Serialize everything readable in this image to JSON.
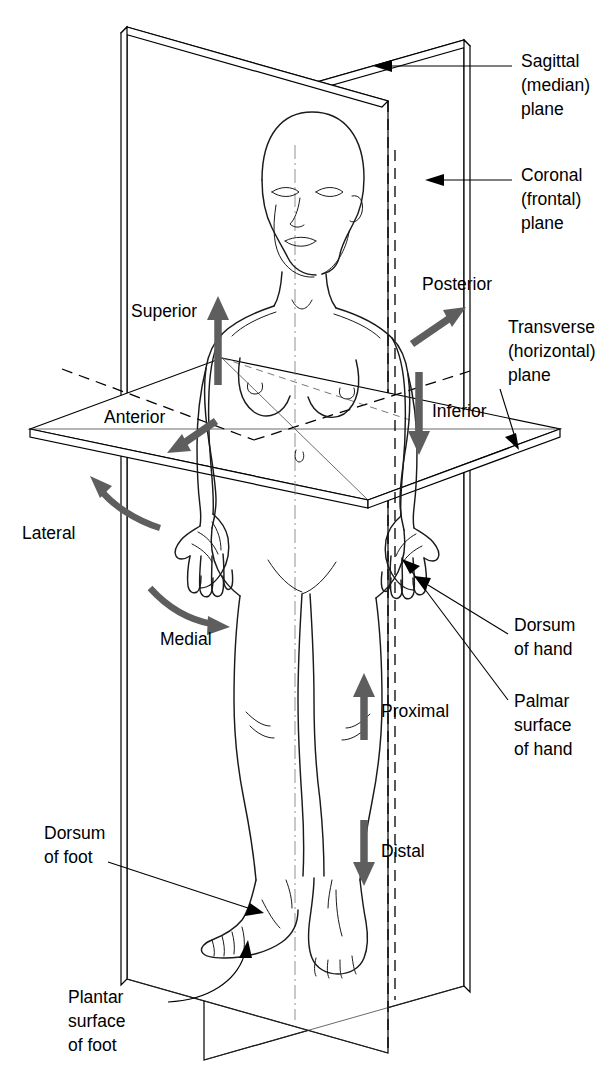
{
  "diagram": {
    "accent_color": "#5e5e5e",
    "line_color": "#000000",
    "background": "#ffffff"
  },
  "plane_labels": [
    {
      "id": "sagittal",
      "lines": [
        "Sagittal",
        "(median)",
        "plane"
      ],
      "line1": "Sagittal",
      "line2": "(median)",
      "line3": "plane"
    },
    {
      "id": "coronal",
      "lines": [
        "Coronal",
        "(frontal)",
        "plane"
      ],
      "line1": "Coronal",
      "line2": "(frontal)",
      "line3": "plane"
    },
    {
      "id": "transverse",
      "lines": [
        "Transverse",
        "(horizontal)",
        "plane"
      ],
      "line1": "Transverse",
      "line2": "(horizontal)",
      "line3": "plane"
    }
  ],
  "direction_labels": [
    {
      "id": "superior",
      "text": "Superior",
      "arrow": "up"
    },
    {
      "id": "inferior",
      "text": "Inferior",
      "arrow": "down"
    },
    {
      "id": "anterior",
      "text": "Anterior",
      "arrow": "down-left"
    },
    {
      "id": "posterior",
      "text": "Posterior",
      "arrow": "up-right"
    },
    {
      "id": "lateral",
      "text": "Lateral",
      "arrow": "curved-up-left"
    },
    {
      "id": "medial",
      "text": "Medial",
      "arrow": "curved-right"
    },
    {
      "id": "proximal",
      "text": "Proximal",
      "arrow": "up"
    },
    {
      "id": "distal",
      "text": "Distal",
      "arrow": "down"
    }
  ],
  "surface_labels": [
    {
      "id": "dorsum-hand",
      "line1": "Dorsum",
      "line2": "of hand"
    },
    {
      "id": "palmar-hand",
      "line1": "Palmar",
      "line2": "surface",
      "line3": "of hand"
    },
    {
      "id": "dorsum-foot",
      "line1": "Dorsum",
      "line2": "of foot"
    },
    {
      "id": "plantar-foot",
      "line1": "Plantar",
      "line2": "surface",
      "line3": "of foot"
    }
  ]
}
